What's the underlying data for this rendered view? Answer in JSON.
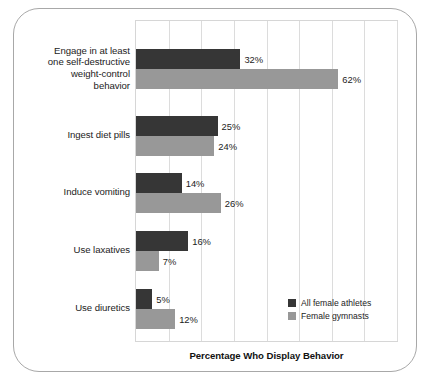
{
  "figure": {
    "frame_border_color": "#a8a8a8",
    "background": "#ffffff"
  },
  "chart_data": {
    "type": "bar",
    "orientation": "horizontal",
    "title": "",
    "xlabel": "Percentage Who Display Behavior",
    "ylabel": "",
    "xlim": [
      0,
      80
    ],
    "grid": true,
    "gridlines": [
      0,
      10,
      20,
      30,
      40,
      50,
      60,
      70,
      80
    ],
    "legend_position": "bottom-right",
    "value_suffix": "%",
    "categories": [
      "Engage in at least one self-destructive weight-control behavior",
      "Ingest diet pills",
      "Induce vomiting",
      "Use laxatives",
      "Use diuretics"
    ],
    "category_label_lines": [
      [
        "Engage in at least",
        "one self-destructive",
        "weight-control",
        "behavior"
      ],
      [
        "Ingest diet pills"
      ],
      [
        "Induce vomiting"
      ],
      [
        "Use laxatives"
      ],
      [
        "Use diuretics"
      ]
    ],
    "series": [
      {
        "name": "All female athletes",
        "color": "#363636",
        "values": [
          32,
          25,
          14,
          16,
          5
        ],
        "labels": [
          "32%",
          "25%",
          "14%",
          "16%",
          "5%"
        ]
      },
      {
        "name": "Female gymnasts",
        "color": "#989898",
        "values": [
          62,
          24,
          26,
          7,
          12
        ],
        "labels": [
          "62%",
          "24%",
          "26%",
          "7%",
          "12%"
        ]
      }
    ]
  },
  "axis": {
    "title": "Percentage Who Display Behavior"
  },
  "legend": {
    "items": [
      {
        "label": "All female athletes",
        "color": "#363636"
      },
      {
        "label": "Female gymnasts",
        "color": "#989898"
      }
    ]
  }
}
